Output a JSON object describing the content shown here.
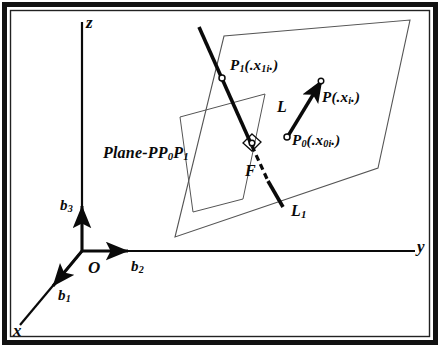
{
  "figure": {
    "kind": "geometry-diagram",
    "frame_color": "#111111",
    "ink_color": "#0a0a0a",
    "thin_color": "#555555",
    "background": "#ffffff"
  },
  "axes": {
    "z_label": "z",
    "y_label": "y",
    "x_label": "x",
    "origin_label": "O",
    "basis": [
      {
        "name": "b1",
        "base": "b",
        "sub": "1"
      },
      {
        "name": "b2",
        "base": "b",
        "sub": "2"
      },
      {
        "name": "b3",
        "base": "b",
        "sub": "3"
      }
    ]
  },
  "plane": {
    "label_prefix": "Plane-PP",
    "label_sub_0": "0",
    "label_mid": "P",
    "label_sub_1": "1"
  },
  "lines": {
    "L": {
      "label": "L"
    },
    "L1": {
      "base": "L",
      "sub": "1"
    }
  },
  "points": {
    "P": {
      "base": "P",
      "sub": "",
      "args": "(.x",
      "arg_sub": "i",
      "args_end": ".)"
    },
    "P0": {
      "base": "P",
      "sub": "0",
      "args": "(.x",
      "arg_sub": "0i",
      "args_end": ".)"
    },
    "P1": {
      "base": "P",
      "sub": "1",
      "args": "(.x",
      "arg_sub": "1i",
      "args_end": ".)"
    },
    "F": {
      "label": "F"
    }
  }
}
